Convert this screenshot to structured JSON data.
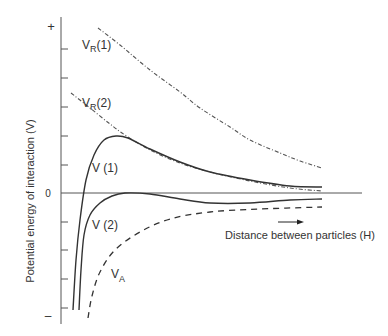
{
  "chart_data": {
    "type": "line",
    "title": "",
    "xlabel": "Distance between particles (H)",
    "ylabel": "Potential energy of interaction (V)",
    "y_tick_labels": {
      "top": "+",
      "zero": "0",
      "bottom": "–"
    },
    "grid": false,
    "legend": "inline labels",
    "x_range": [
      0,
      1
    ],
    "y_range": [
      -1,
      1
    ],
    "series": [
      {
        "name": "VR(1)",
        "label_main": "V",
        "label_sub": "R",
        "label_suffix": "(1)",
        "style": "dash-dot",
        "points_px": [
          [
            98,
            28
          ],
          [
            120,
            45
          ],
          [
            150,
            70
          ],
          [
            180,
            92
          ],
          [
            200,
            108
          ],
          [
            230,
            127
          ],
          [
            250,
            140
          ],
          [
            280,
            153
          ],
          [
            300,
            161
          ],
          [
            322,
            168
          ]
        ]
      },
      {
        "name": "VR(2)",
        "label_main": "V",
        "label_sub": "R",
        "label_suffix": "(2)",
        "style": "dash-dot",
        "points_px": [
          [
            71,
            93
          ],
          [
            90,
            108
          ],
          [
            110,
            124
          ],
          [
            125,
            135
          ],
          [
            150,
            150
          ],
          [
            180,
            163
          ],
          [
            210,
            172
          ],
          [
            250,
            181
          ],
          [
            290,
            188
          ],
          [
            322,
            191
          ]
        ]
      },
      {
        "name": "V (1)",
        "label_main": "V (1)",
        "style": "solid",
        "points_px": [
          [
            73,
            310
          ],
          [
            76,
            260
          ],
          [
            80,
            220
          ],
          [
            86,
            180
          ],
          [
            94,
            155
          ],
          [
            104,
            140
          ],
          [
            116,
            136
          ],
          [
            128,
            138
          ],
          [
            150,
            149
          ],
          [
            180,
            162
          ],
          [
            210,
            172
          ],
          [
            250,
            180
          ],
          [
            290,
            186
          ],
          [
            322,
            187
          ]
        ]
      },
      {
        "name": "V (2)",
        "label_main": "V (2)",
        "style": "solid",
        "points_px": [
          [
            79,
            310
          ],
          [
            81,
            270
          ],
          [
            84,
            235
          ],
          [
            90,
            215
          ],
          [
            100,
            203
          ],
          [
            112,
            196
          ],
          [
            125,
            193
          ],
          [
            150,
            194
          ],
          [
            180,
            199
          ],
          [
            210,
            203
          ],
          [
            250,
            203
          ],
          [
            290,
            200
          ],
          [
            322,
            199
          ]
        ]
      },
      {
        "name": "VA",
        "label_main": "V",
        "label_sub": "A",
        "label_suffix": "",
        "style": "dashed",
        "points_px": [
          [
            88,
            318
          ],
          [
            92,
            296
          ],
          [
            100,
            272
          ],
          [
            115,
            250
          ],
          [
            140,
            232
          ],
          [
            170,
            219
          ],
          [
            210,
            212
          ],
          [
            260,
            209
          ],
          [
            322,
            207
          ]
        ]
      }
    ],
    "annotation": {
      "arrow": "→ direction of increasing H"
    }
  }
}
